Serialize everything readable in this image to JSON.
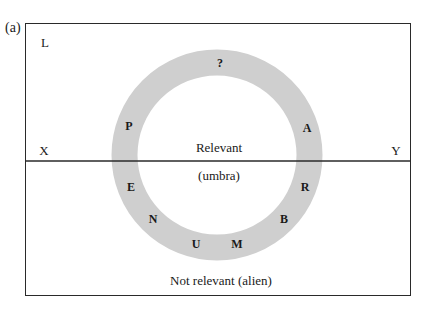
{
  "figure": {
    "label": "(a)",
    "corner_label": "L",
    "axis_left_label": "X",
    "axis_right_label": "Y",
    "upper_region_label": "Relevant",
    "umbra_label": "(umbra)",
    "lower_region_label": "Not relevant (alien)",
    "ring": {
      "letters": [
        "?",
        "P",
        "E",
        "N",
        "U",
        "M",
        "B",
        "R",
        "A"
      ],
      "spells": "PENUMBRA",
      "color": "#cfcfcf"
    },
    "colors": {
      "line": "#2a2a2a",
      "background": "#ffffff"
    }
  }
}
